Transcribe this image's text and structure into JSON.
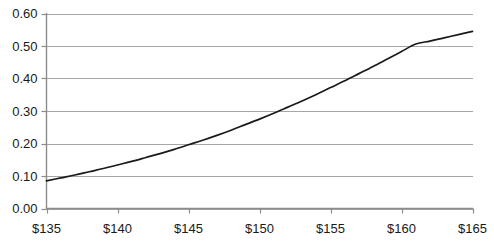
{
  "chart_data": {
    "type": "line",
    "title": "",
    "xlabel": "",
    "ylabel": "",
    "xlim": [
      135,
      165
    ],
    "ylim": [
      0.0,
      0.6
    ],
    "grid": true,
    "grid_axis": "y",
    "legend": "none",
    "line_color": "#1a1a1a",
    "grid_color": "#a6a6a6",
    "axis_color": "#808080",
    "background": "#ffffff",
    "x_tick_labels": [
      "$135",
      "$140",
      "$145",
      "$150",
      "$155",
      "$160",
      "$165"
    ],
    "x_tick_values": [
      135,
      140,
      145,
      150,
      155,
      160,
      165
    ],
    "y_tick_labels": [
      "0.00",
      "0.10",
      "0.20",
      "0.30",
      "0.40",
      "0.50",
      "0.60"
    ],
    "y_tick_values": [
      0.0,
      0.1,
      0.2,
      0.3,
      0.4,
      0.5,
      0.6
    ],
    "series": [
      {
        "name": "",
        "x": [
          135,
          136,
          137,
          138,
          139,
          140,
          141,
          142,
          143,
          144,
          145,
          146,
          147,
          148,
          149,
          150,
          151,
          152,
          153,
          154,
          155,
          156,
          157,
          158,
          159,
          160,
          161,
          162,
          163,
          164,
          165
        ],
        "y": [
          0.085,
          0.094,
          0.103,
          0.113,
          0.123,
          0.134,
          0.145,
          0.157,
          0.169,
          0.182,
          0.196,
          0.21,
          0.225,
          0.241,
          0.258,
          0.275,
          0.293,
          0.312,
          0.331,
          0.351,
          0.372,
          0.393,
          0.415,
          0.437,
          0.46,
          0.483,
          0.506,
          0.515,
          0.525,
          0.535,
          0.545
        ]
      }
    ]
  }
}
